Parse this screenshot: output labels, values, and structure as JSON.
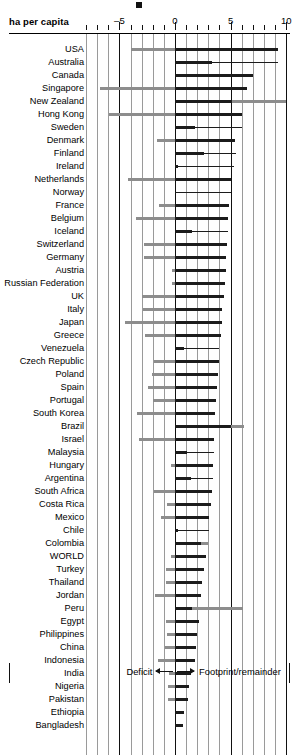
{
  "chart_data": {
    "type": "bar",
    "title": "",
    "axis_title": "ha per capita",
    "xlabel": "",
    "ylabel": "",
    "xlim": [
      -8.5,
      10.3
    ],
    "xticks_major": [
      -5,
      0,
      5,
      10
    ],
    "xtick_labels": [
      "–5",
      "0",
      "5",
      "10"
    ],
    "xticks_minor": [
      -8,
      -7,
      -6,
      -4,
      -3,
      -2,
      -1,
      1,
      2,
      3,
      4,
      6,
      7,
      8,
      9
    ],
    "grid": true,
    "legend": {
      "position": "bottom",
      "deficit_label": "Deficit",
      "footprint_label": "Footprint/remainder"
    },
    "series_names": [
      "Deficit",
      "Footprint",
      "Remainder"
    ],
    "colors": {
      "deficit": "#8d8d8d",
      "footprint": "#1b1b1b",
      "remainder": "#8d8d8d",
      "gridline": "#9a9a9a",
      "axis": "#111111",
      "background": "#ffffff"
    },
    "categories": [
      "USA",
      "Australia",
      "Canada",
      "Singapore",
      "New Zealand",
      "Hong Kong",
      "Sweden",
      "Denmark",
      "Finland",
      "Ireland",
      "Netherlands",
      "Norway",
      "France",
      "Belgium",
      "Iceland",
      "Switzerland",
      "Germany",
      "Austria",
      "Russian Federation",
      "UK",
      "Italy",
      "Japan",
      "Greece",
      "Venezuela",
      "Czech Republic",
      "Poland",
      "Spain",
      "Portugal",
      "South Korea",
      "Brazil",
      "Israel",
      "Malaysia",
      "Hungary",
      "Argentina",
      "South Africa",
      "Costa Rica",
      "Mexico",
      "Chile",
      "Colombia",
      "WORLD",
      "Turkey",
      "Thailand",
      "Jordan",
      "Peru",
      "Egypt",
      "Philippines",
      "China",
      "Indonesia",
      "India",
      "Nigeria",
      "Pakistan",
      "Ethiopia",
      "Bangladesh"
    ],
    "rows": [
      {
        "name": "USA",
        "deficit": -4.0,
        "footprint": 9.3,
        "remainder": 0
      },
      {
        "name": "Australia",
        "deficit": 0,
        "footprint": 3.3,
        "remainder": 0,
        "tail_to": 9.3
      },
      {
        "name": "Canada",
        "deficit": 0,
        "footprint": 7.0,
        "remainder": 0
      },
      {
        "name": "Singapore",
        "deficit": -6.7,
        "footprint": 6.5,
        "remainder": 0
      },
      {
        "name": "New Zealand",
        "deficit": 0,
        "footprint": 5.1,
        "remainder": 10.0
      },
      {
        "name": "Hong Kong",
        "deficit": -5.9,
        "footprint": 6.0,
        "remainder": 0
      },
      {
        "name": "Sweden",
        "deficit": 0,
        "footprint": 1.8,
        "remainder": 0,
        "tail_to": 6.0
      },
      {
        "name": "Denmark",
        "deficit": -1.6,
        "footprint": 5.4,
        "remainder": 0
      },
      {
        "name": "Finland",
        "deficit": 0,
        "footprint": 2.6,
        "remainder": 0,
        "tail_to": 5.5
      },
      {
        "name": "Ireland",
        "deficit": 0,
        "footprint": 0.3,
        "remainder": 0,
        "tail_to": 5.3
      },
      {
        "name": "Netherlands",
        "deficit": -4.2,
        "footprint": 5.0,
        "remainder": 0
      },
      {
        "name": "Norway",
        "deficit": 0,
        "footprint": 0.0,
        "remainder": 0,
        "tail_to": 5.0
      },
      {
        "name": "France",
        "deficit": -1.4,
        "footprint": 4.9,
        "remainder": 0
      },
      {
        "name": "Belgium",
        "deficit": -3.5,
        "footprint": 4.8,
        "remainder": 0
      },
      {
        "name": "Iceland",
        "deficit": 0,
        "footprint": 1.5,
        "remainder": 0,
        "tail_to": 4.8
      },
      {
        "name": "Switzerland",
        "deficit": -2.8,
        "footprint": 4.7,
        "remainder": 0
      },
      {
        "name": "Germany",
        "deficit": -2.8,
        "footprint": 4.6,
        "remainder": 0
      },
      {
        "name": "Austria",
        "deficit": -0.3,
        "footprint": 4.6,
        "remainder": 0
      },
      {
        "name": "Russian Federation",
        "deficit": -0.3,
        "footprint": 4.5,
        "remainder": 0
      },
      {
        "name": "UK",
        "deficit": -3.0,
        "footprint": 4.4,
        "remainder": 0
      },
      {
        "name": "Italy",
        "deficit": -2.9,
        "footprint": 4.2,
        "remainder": 0
      },
      {
        "name": "Japan",
        "deficit": -4.5,
        "footprint": 4.2,
        "remainder": 0
      },
      {
        "name": "Greece",
        "deficit": -2.7,
        "footprint": 4.1,
        "remainder": 0
      },
      {
        "name": "Venezuela",
        "deficit": 0,
        "footprint": 0.8,
        "remainder": 0,
        "tail_to": 4.0
      },
      {
        "name": "Czech Republic",
        "deficit": -1.9,
        "footprint": 4.0,
        "remainder": 0
      },
      {
        "name": "Poland",
        "deficit": -2.1,
        "footprint": 3.9,
        "remainder": 0
      },
      {
        "name": "Spain",
        "deficit": -2.4,
        "footprint": 3.8,
        "remainder": 0
      },
      {
        "name": "Portugal",
        "deficit": -2.0,
        "footprint": 3.7,
        "remainder": 0
      },
      {
        "name": "South Korea",
        "deficit": -3.4,
        "footprint": 3.6,
        "remainder": 0
      },
      {
        "name": "Brazil",
        "deficit": 0,
        "footprint": 5.0,
        "remainder": 6.2
      },
      {
        "name": "Israel",
        "deficit": -3.2,
        "footprint": 3.5,
        "remainder": 0
      },
      {
        "name": "Malaysia",
        "deficit": 0,
        "footprint": 1.1,
        "remainder": 0,
        "tail_to": 3.5
      },
      {
        "name": "Hungary",
        "deficit": -0.4,
        "footprint": 3.4,
        "remainder": 0
      },
      {
        "name": "Argentina",
        "deficit": 0,
        "footprint": 1.4,
        "remainder": 0,
        "tail_to": 3.4
      },
      {
        "name": "South Africa",
        "deficit": -1.9,
        "footprint": 3.3,
        "remainder": 0
      },
      {
        "name": "Costa Rica",
        "deficit": -0.7,
        "footprint": 3.2,
        "remainder": 0
      },
      {
        "name": "Mexico",
        "deficit": -1.3,
        "footprint": 3.1,
        "remainder": 0
      },
      {
        "name": "Chile",
        "deficit": 0,
        "footprint": 0.3,
        "remainder": 0,
        "tail_to": 3.1
      },
      {
        "name": "Colombia",
        "deficit": 0,
        "footprint": 2.3,
        "remainder": 3.0
      },
      {
        "name": "WORLD",
        "deficit": -0.4,
        "footprint": 2.8,
        "remainder": 0
      },
      {
        "name": "Turkey",
        "deficit": -0.8,
        "footprint": 2.6,
        "remainder": 0
      },
      {
        "name": "Thailand",
        "deficit": -0.8,
        "footprint": 2.4,
        "remainder": 0
      },
      {
        "name": "Jordan",
        "deficit": -1.8,
        "footprint": 2.3,
        "remainder": 0
      },
      {
        "name": "Peru",
        "deficit": 0,
        "footprint": 1.5,
        "remainder": 6.1
      },
      {
        "name": "Egypt",
        "deficit": -0.8,
        "footprint": 2.2,
        "remainder": 0
      },
      {
        "name": "Philippines",
        "deficit": -0.7,
        "footprint": 2.0,
        "remainder": 0
      },
      {
        "name": "China",
        "deficit": -0.9,
        "footprint": 1.9,
        "remainder": 0
      },
      {
        "name": "Indonesia",
        "deficit": -1.5,
        "footprint": 1.8,
        "remainder": 0
      },
      {
        "name": "India",
        "deficit": -0.5,
        "footprint": 1.4,
        "remainder": 0
      },
      {
        "name": "Nigeria",
        "deficit": -0.6,
        "footprint": 1.3,
        "remainder": 0
      },
      {
        "name": "Pakistan",
        "deficit": -0.6,
        "footprint": 1.2,
        "remainder": 0
      },
      {
        "name": "Ethiopia",
        "deficit": 0,
        "footprint": 0.8,
        "remainder": 0
      },
      {
        "name": "Bangladesh",
        "deficit": 0,
        "footprint": 0.7,
        "remainder": 0
      }
    ]
  }
}
